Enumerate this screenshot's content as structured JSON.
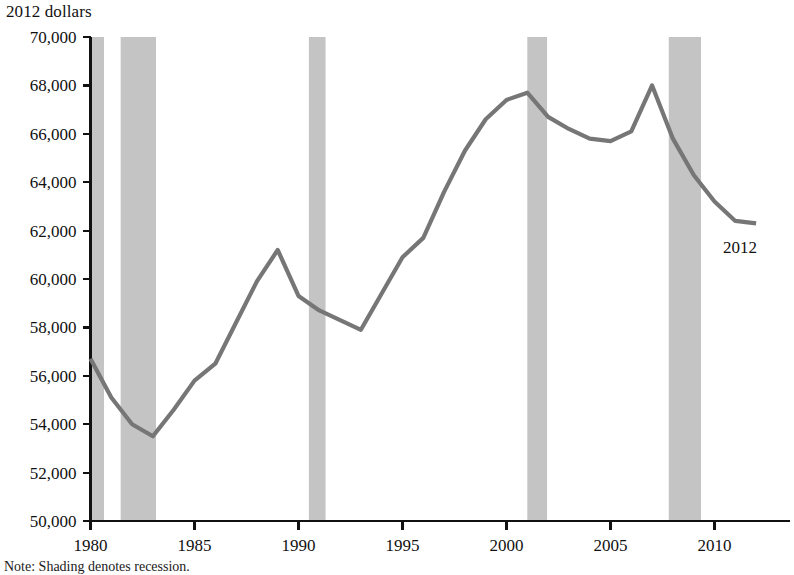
{
  "chart_data": {
    "type": "line",
    "title": "",
    "ylabel": "2012 dollars",
    "xlabel": "",
    "ylim": [
      50000,
      70000
    ],
    "xlim": [
      1980,
      2012
    ],
    "y_ticks": [
      50000,
      52000,
      54000,
      56000,
      58000,
      60000,
      62000,
      64000,
      66000,
      68000,
      70000
    ],
    "y_tick_labels": [
      "50,000",
      "52,000",
      "54,000",
      "56,000",
      "58,000",
      "60,000",
      "62,000",
      "64,000",
      "66,000",
      "68,000",
      "70,000"
    ],
    "x_ticks": [
      1980,
      1985,
      1990,
      1995,
      2000,
      2005,
      2010
    ],
    "x_tick_labels": [
      "1980",
      "1985",
      "1990",
      "1995",
      "2000",
      "2005",
      "2010"
    ],
    "grid": false,
    "legend": null,
    "line_color": "#767676",
    "shading_color": "#c4c4c4",
    "x": [
      1980,
      1981,
      1982,
      1983,
      1984,
      1985,
      1986,
      1987,
      1988,
      1989,
      1990,
      1991,
      1992,
      1993,
      1994,
      1995,
      1996,
      1997,
      1998,
      1999,
      2000,
      2001,
      2002,
      2003,
      2004,
      2005,
      2006,
      2007,
      2008,
      2009,
      2010,
      2011,
      2012
    ],
    "values": [
      56700,
      55100,
      54000,
      53500,
      54600,
      55800,
      56500,
      58200,
      59900,
      61200,
      59300,
      58700,
      58300,
      57900,
      59400,
      60900,
      61700,
      63600,
      65300,
      66600,
      67400,
      67700,
      66700,
      66200,
      65800,
      65700,
      66100,
      68000,
      65800,
      64300,
      63200,
      62400,
      62300
    ],
    "annotations": [
      {
        "text": "2012",
        "x": 2012,
        "y": 62300,
        "position": "below-right"
      }
    ],
    "recession_bands": [
      {
        "start": 1980.05,
        "end": 1980.65
      },
      {
        "start": 1981.45,
        "end": 1983.15
      },
      {
        "start": 1990.5,
        "end": 1991.3
      },
      {
        "start": 2001.0,
        "end": 2001.95
      },
      {
        "start": 2007.8,
        "end": 2009.35
      }
    ],
    "note": "Note: Shading denotes recession."
  }
}
